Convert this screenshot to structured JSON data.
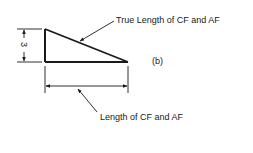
{
  "figure": {
    "label": "(b)",
    "dimension_height": "3",
    "labels": {
      "true_length": "True Length of CF and AF",
      "length": "Length of CF and AF"
    },
    "colors": {
      "ink": "#1a1a1a",
      "background": "#ffffff"
    }
  }
}
